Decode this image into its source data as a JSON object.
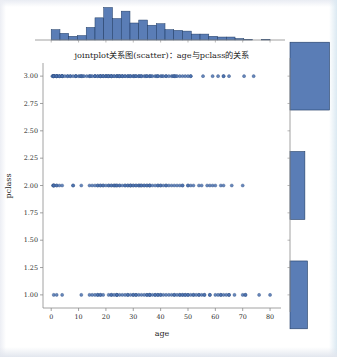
{
  "figure": {
    "title": "jointplot关系图(scatter)：age与pclass的关系",
    "xlabel": "age",
    "ylabel": "pclass",
    "marker_color": "#4c72b0",
    "marker_edge_color": "#2b4a7d",
    "bar_color": "#4c72b0",
    "bar_edge_color": "#1f3b63",
    "axis_color": "#8a8a8a",
    "background": "#ffffff"
  },
  "chart_data": {
    "type": "scatter",
    "title": "jointplot关系图(scatter)：age与pclass的关系",
    "xlabel": "age",
    "ylabel": "pclass",
    "xlim": [
      -3,
      84
    ],
    "ylim": [
      0.88,
      3.12
    ],
    "xticks": [
      0,
      10,
      20,
      30,
      40,
      50,
      60,
      70,
      80
    ],
    "xtick_labels": [
      "0",
      "10",
      "20",
      "30",
      "40",
      "50",
      "60",
      "70",
      "80"
    ],
    "yticks": [
      1.0,
      1.25,
      1.5,
      1.75,
      2.0,
      2.25,
      2.5,
      2.75,
      3.0
    ],
    "ytick_labels": [
      "1.00",
      "1.25",
      "1.50",
      "1.75",
      "2.00",
      "2.25",
      "2.50",
      "2.75",
      "3.00"
    ],
    "grid": false,
    "legend": null,
    "series": [
      {
        "name": "pclass = 3",
        "y": 3.0,
        "x": [
          0.42,
          0.75,
          0.83,
          0.92,
          1,
          1,
          1,
          1,
          1,
          2,
          2,
          2,
          2,
          2,
          2,
          3,
          3,
          3,
          4,
          4,
          4,
          4,
          4,
          5,
          6,
          6,
          7,
          7,
          8,
          9,
          9,
          9,
          10,
          10.5,
          11,
          11,
          11.5,
          12,
          13,
          14,
          14,
          14.5,
          15,
          16,
          16,
          16,
          17,
          17,
          18,
          18,
          18,
          18,
          19,
          19,
          19,
          20,
          20,
          20,
          20.5,
          21,
          21,
          21,
          22,
          22,
          22,
          22,
          23,
          23,
          24,
          24,
          24,
          24.5,
          25,
          25,
          25,
          26,
          26,
          26,
          27,
          27,
          28,
          28,
          28.5,
          29,
          29,
          30,
          30,
          30.5,
          31,
          31,
          32,
          32,
          32.5,
          33,
          33,
          34,
          34.5,
          35,
          35,
          36,
          36,
          36.5,
          37,
          38,
          38.5,
          39,
          39,
          40,
          40.5,
          41,
          42,
          42,
          43,
          44,
          44.5,
          45,
          45,
          45.5,
          46,
          47,
          48,
          49,
          50,
          51,
          51,
          55.5,
          59,
          61,
          63,
          63,
          65,
          70.5,
          74
        ]
      },
      {
        "name": "pclass = 2",
        "y": 2.0,
        "x": [
          0.67,
          0.83,
          0.92,
          1,
          1,
          2,
          2,
          3,
          4,
          8,
          8,
          11,
          14,
          15,
          16,
          17,
          17,
          18,
          18,
          19,
          19,
          20,
          21,
          21,
          22,
          22,
          23,
          23,
          23.5,
          24,
          24,
          25,
          25,
          26,
          27,
          27,
          28,
          28,
          29,
          29,
          29,
          30,
          30,
          31,
          31,
          32,
          32,
          32.5,
          33,
          33,
          34,
          34,
          35,
          35,
          36,
          36,
          36,
          37,
          38,
          39,
          39,
          40,
          40,
          41,
          42,
          42,
          43,
          44,
          45,
          46,
          47,
          48,
          48,
          50,
          50,
          51,
          52,
          54,
          55,
          57,
          58,
          59,
          60,
          62,
          63,
          66,
          70
        ]
      },
      {
        "name": "pclass = 1",
        "y": 1.0,
        "x": [
          0.92,
          2,
          4,
          11,
          14,
          15,
          16,
          17,
          17,
          18,
          18,
          19,
          21,
          22,
          22,
          23,
          24,
          24,
          24,
          25,
          26,
          27,
          28,
          28,
          29,
          30,
          30,
          31,
          31,
          32,
          33,
          34,
          35,
          35,
          36,
          36,
          36,
          37,
          38,
          38,
          39,
          39,
          40,
          40,
          41,
          42,
          43,
          44,
          45,
          45,
          46,
          47,
          47,
          48,
          48,
          49,
          49,
          50,
          50,
          51,
          52,
          52,
          53,
          54,
          54,
          55,
          56,
          56,
          58,
          58,
          60,
          61,
          62,
          62,
          63,
          64,
          65,
          65,
          67,
          70,
          71,
          71,
          76,
          80
        ]
      }
    ],
    "marginal_x": {
      "type": "bar",
      "orientation": "vertical",
      "name": "age distribution",
      "bin_edges": [
        0,
        3.2,
        6.4,
        9.6,
        12.8,
        16,
        19.2,
        22.4,
        25.6,
        28.8,
        32,
        35.2,
        38.4,
        41.6,
        44.8,
        48,
        51.2,
        54.4,
        57.6,
        60.8,
        64,
        67.2,
        70.4,
        73.6,
        76.8,
        80
      ],
      "values": [
        14,
        9,
        5,
        6,
        17,
        30,
        44,
        29,
        39,
        23,
        27,
        20,
        22,
        14,
        13,
        12,
        8,
        8,
        5,
        4,
        4,
        2,
        1,
        0,
        1
      ],
      "ymax": 46
    },
    "marginal_y": {
      "type": "bar",
      "orientation": "horizontal",
      "name": "pclass distribution",
      "categories": [
        "1",
        "2",
        "3"
      ],
      "centers": [
        1.0,
        2.0,
        3.0
      ],
      "values": [
        216,
        184,
        491
      ],
      "xmax": 520
    }
  },
  "axes": {
    "joint": {
      "x": 43,
      "y": 63,
      "width": 238,
      "height": 245
    },
    "marginal_top": {
      "x": 43,
      "y": 6,
      "width": 238,
      "height": 34
    },
    "marginal_right": {
      "x": 290,
      "y": 63,
      "width": 42,
      "height": 245
    }
  }
}
